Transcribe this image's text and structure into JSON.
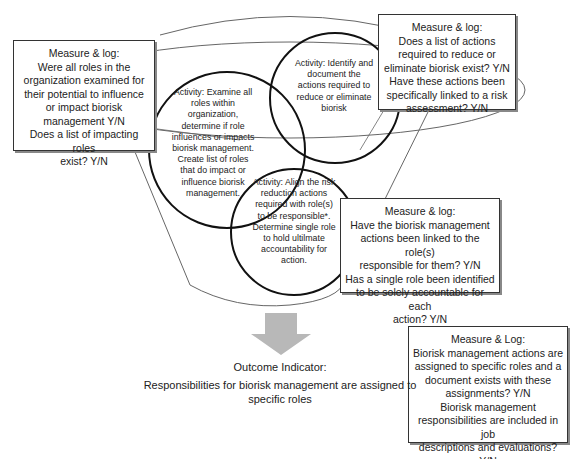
{
  "diagram": {
    "type": "funnel",
    "measure_boxes": [
      {
        "id": "roles-examined",
        "title": "Measure & log:",
        "lines": [
          "Were all roles in the",
          "organization examined for",
          "their potential to influence",
          "or impact biorisk",
          "management Y/N",
          "Does a list of impacting roles",
          "exist? Y/N"
        ]
      },
      {
        "id": "actions-list",
        "title": "Measure & log:",
        "lines": [
          "Does a list of actions",
          "required to reduce or",
          "eliminate biorisk exist? Y/N",
          "Have these actions been",
          "specifically linked to a risk",
          "assessment? Y/N"
        ]
      },
      {
        "id": "actions-linked",
        "title": "Measure & log:",
        "lines": [
          "Have the biorisk management",
          "actions been linked to the role(s)",
          "responsible for them? Y/N",
          "Has a single role been identified",
          "to be solely accountable for each",
          "action? Y/N"
        ]
      },
      {
        "id": "outcome-measure",
        "title": "Measure & Log:",
        "lines": [
          "Biorisk management actions are",
          "assigned to specific roles and a",
          "document exists with these",
          "assignments?  Y/N",
          "Biorisk management",
          "responsibilities are included in job",
          "descriptions and evaluations? Y/N"
        ]
      }
    ],
    "activities": [
      {
        "id": "examine-roles",
        "lines": [
          "Activity: Examine all",
          "roles  within",
          "organization,",
          "determine if role",
          "influences or impacts",
          "biorisk management.",
          "Create list of roles",
          "that do impact or",
          "influence biorisk",
          "management."
        ]
      },
      {
        "id": "identify-actions",
        "lines": [
          "Activity: Identify  and",
          "document the",
          "actions required to",
          "reduce or eliminate",
          "biorisk"
        ]
      },
      {
        "id": "align-actions",
        "lines": [
          "Activity: Align the risk",
          "reduction actions",
          "required with role(s)",
          "to be responsible*.",
          "Determine single role",
          "to hold ultilmate",
          "accountability for",
          "action."
        ]
      }
    ],
    "outcome": {
      "label": "Outcome Indicator:",
      "text_line1": "Responsibilities for biorisk management are assigned to",
      "text_line2": "specific roles"
    },
    "colors": {
      "arrow": "#b8b8b8",
      "funnel_line": "#555555",
      "circle_line": "#111111"
    }
  }
}
